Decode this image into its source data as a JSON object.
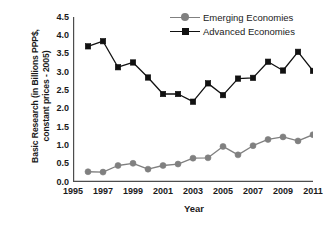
{
  "chart_data": {
    "type": "line",
    "title": "",
    "xlabel": "Year",
    "ylabel": "Basic Research (in Billions PPP$, constant prices - 2005)",
    "ylabel_line1": "Basic Research (in Billions PPP$,",
    "ylabel_line2": "constant prices - 2005)",
    "x": [
      1996,
      1997,
      1998,
      1999,
      2000,
      2001,
      2002,
      2003,
      2004,
      2005,
      2006,
      2007,
      2008,
      2009,
      2010,
      2011
    ],
    "xlim": [
      1995,
      2011
    ],
    "ylim": [
      0.0,
      4.5
    ],
    "grid": false,
    "legend_position": "top-right",
    "xtick_labels": [
      "1995",
      "1997",
      "1999",
      "2001",
      "2003",
      "2005",
      "2007",
      "2009",
      "2011"
    ],
    "xtick_values": [
      1995,
      1997,
      1999,
      2001,
      2003,
      2005,
      2007,
      2009,
      2011
    ],
    "ytick_labels": [
      "0.0",
      "0.5",
      "1.0",
      "1.5",
      "2.0",
      "2.5",
      "3.0",
      "3.5",
      "4.0",
      "4.5"
    ],
    "ytick_values": [
      0.0,
      0.5,
      1.0,
      1.5,
      2.0,
      2.5,
      3.0,
      3.5,
      4.0,
      4.5
    ],
    "series": [
      {
        "name": "Emerging Economies",
        "color": "#808080",
        "marker": "circle",
        "values": [
          0.28,
          0.27,
          0.45,
          0.51,
          0.35,
          0.45,
          0.49,
          0.65,
          0.66,
          0.97,
          0.74,
          0.99,
          1.16,
          1.23,
          1.12,
          1.29
        ]
      },
      {
        "name": "Advanced Economies",
        "color": "#111111",
        "marker": "square",
        "values": [
          3.7,
          3.84,
          3.13,
          3.26,
          2.85,
          2.4,
          2.4,
          2.19,
          2.69,
          2.37,
          2.82,
          2.84,
          3.28,
          3.04,
          3.55,
          3.03
        ]
      }
    ]
  }
}
